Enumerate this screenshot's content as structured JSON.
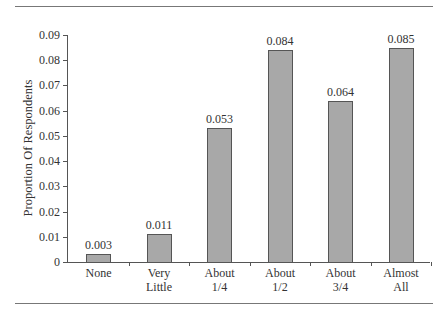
{
  "chart_data": {
    "type": "bar",
    "title": "",
    "xlabel": "",
    "ylabel": "Proportion Of Respondents",
    "categories": [
      "None",
      "Very\nLittle",
      "About\n1/4",
      "About\n1/2",
      "About\n3/4",
      "Almost\nAll"
    ],
    "values": [
      0.003,
      0.011,
      0.053,
      0.084,
      0.064,
      0.085
    ],
    "value_labels": [
      "0.003",
      "0.011",
      "0.053",
      "0.084",
      "0.064",
      "0.085"
    ],
    "yticks": [
      "0",
      "0.01",
      "0.02",
      "0.03",
      "0.04",
      "0.05",
      "0.06",
      "0.07",
      "0.08",
      "0.09"
    ],
    "ylim": [
      0,
      0.09
    ],
    "grid": false,
    "legend": null,
    "bar_color": "#a8a8a8"
  }
}
